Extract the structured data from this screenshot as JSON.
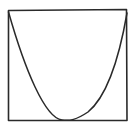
{
  "diagram": {
    "stroke_color": "#2a2a2a",
    "background": "#ffffff",
    "square": {
      "x1": 8,
      "y1": 10,
      "x2": 127,
      "y2": 120
    },
    "parabola": {
      "left_end": [
        8,
        11
      ],
      "vertex": [
        67,
        120
      ],
      "right_end": [
        127,
        12
      ]
    }
  }
}
